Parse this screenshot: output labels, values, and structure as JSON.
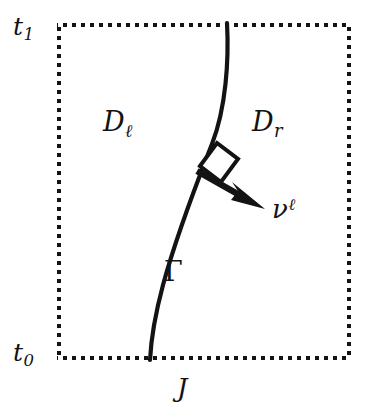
{
  "figure": {
    "background_color": "#ffffff",
    "ink_color": "#131313",
    "width": 374,
    "height": 419
  },
  "boundary": {
    "name": "dotted-rectangle",
    "style": "dotted",
    "left": 57,
    "top": 23,
    "right": 351,
    "bottom": 360,
    "dot_size": 4,
    "dot_period": 9,
    "color": "#131313"
  },
  "labels": {
    "time_top": {
      "base": "t",
      "sub": "1",
      "x": 13,
      "y": 14
    },
    "time_bottom": {
      "base": "t",
      "sub": "0",
      "x": 13,
      "y": 340
    },
    "domain_left": {
      "base": "D",
      "sub": "ℓ",
      "x": 103,
      "y": 108
    },
    "domain_right": {
      "base": "D",
      "sub": "r",
      "x": 252,
      "y": 108
    },
    "normal_vector": {
      "base": "ν",
      "sup": "ℓ",
      "x": 272,
      "y": 196
    },
    "interface_curve": {
      "base": "Γ",
      "x": 164,
      "y": 258
    },
    "spatial_axis": {
      "base": "J",
      "x": 177,
      "y": 375
    }
  },
  "curve": {
    "name": "interface-curve-gamma",
    "path": "M 227 23 C 229 60, 226 108, 212 144 C 200 175, 178 230, 163 285 C 155 315, 151 340, 150 360",
    "stroke_width": 4.2,
    "color": "#131313",
    "top_contact_x": 227,
    "bottom_contact_x": 150
  },
  "normal_arrow": {
    "name": "normal-vector-arrow",
    "tail_x": 197,
    "tail_y": 171,
    "tip_x": 265,
    "tip_y": 209,
    "shaft_width": 6,
    "head_length": 26,
    "head_width": 22,
    "color": "#131313"
  },
  "right_angle_marker": {
    "name": "right-angle-square",
    "points": "199,167 216,143 237,159 220,183",
    "stroke_width": 4,
    "fill": "#ffffff",
    "color": "#131313"
  }
}
